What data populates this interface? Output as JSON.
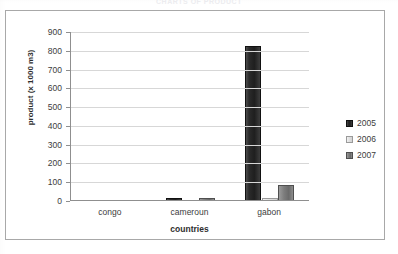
{
  "caption": "CHARTS OF PRODUCT",
  "chart_data": {
    "type": "bar",
    "title": "",
    "xlabel": "countries",
    "ylabel": "product (x 1000 m3)",
    "categories": [
      "congo",
      "cameroun",
      "gabon"
    ],
    "series": [
      {
        "name": "2005",
        "values": [
          0,
          18,
          825
        ],
        "color": "#2b2b2b"
      },
      {
        "name": "2006",
        "values": [
          0,
          0,
          15
        ],
        "color": "#e2e2e2"
      },
      {
        "name": "2007",
        "values": [
          0,
          17,
          85
        ],
        "color": "#7d7d7d"
      }
    ],
    "ylim": [
      0,
      900
    ],
    "yticks": [
      0,
      100,
      200,
      300,
      400,
      500,
      600,
      700,
      800,
      900
    ],
    "ytick_labels": [
      "0",
      "100",
      "200",
      "300",
      "400",
      "500",
      "600",
      "700",
      "800",
      "900"
    ],
    "grid": true,
    "legend_position": "right",
    "legend_entries": [
      "2005",
      "2006",
      "2007"
    ]
  }
}
